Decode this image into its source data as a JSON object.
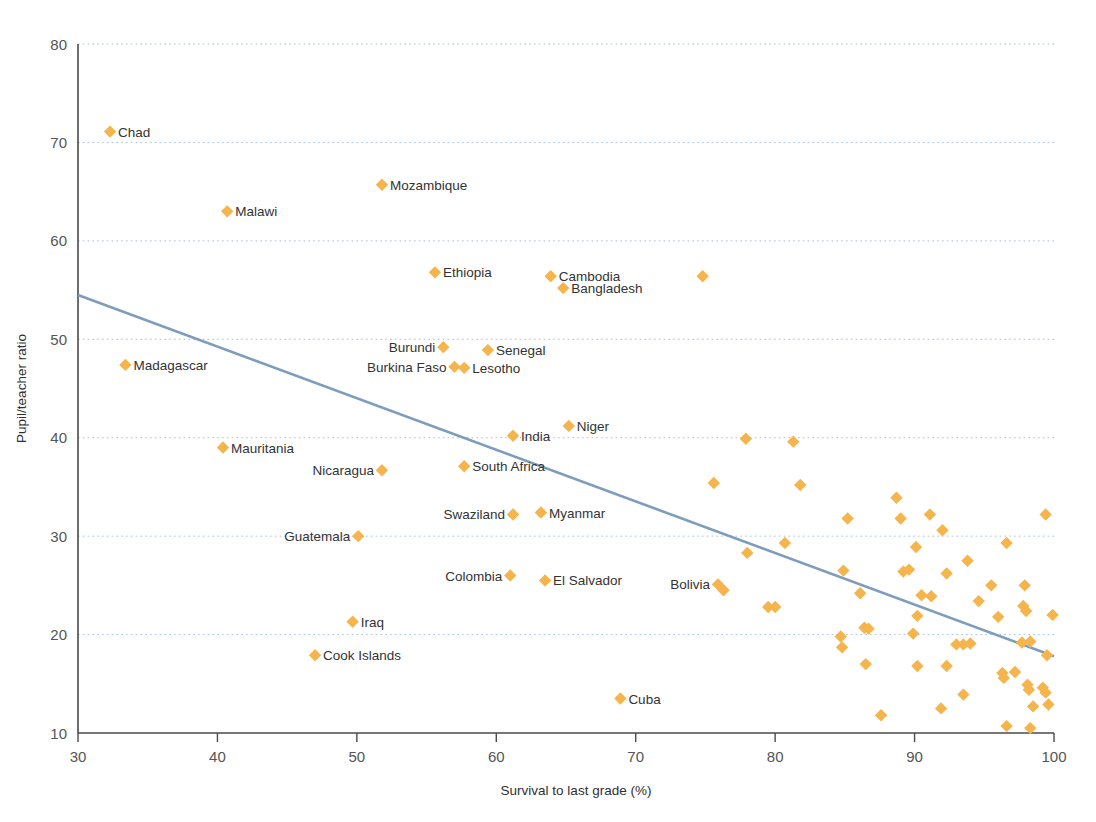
{
  "chart_data": {
    "type": "scatter",
    "title": "",
    "xlabel": "Survival to last grade (%)",
    "ylabel": "Pupil/teacher ratio",
    "xlim": [
      30,
      100
    ],
    "ylim": [
      10,
      80
    ],
    "xticks": [
      30,
      40,
      50,
      60,
      70,
      80,
      90,
      100
    ],
    "yticks": [
      10,
      20,
      30,
      40,
      50,
      60,
      70,
      80
    ],
    "grid": "horizontal-dotted",
    "legend": "none",
    "marker": "diamond",
    "marker_color": "#F5B44C",
    "trendline": {
      "type": "linear",
      "color": "#7E9CBB",
      "x": [
        30,
        100
      ],
      "y": [
        54.5,
        17.8
      ]
    },
    "labeled_points": [
      {
        "label": "Chad",
        "x": 32.3,
        "y": 71.1,
        "label_side": "right"
      },
      {
        "label": "Mozambique",
        "x": 51.8,
        "y": 65.7,
        "label_side": "right"
      },
      {
        "label": "Malawi",
        "x": 40.7,
        "y": 63.0,
        "label_side": "right"
      },
      {
        "label": "Ethiopia",
        "x": 55.6,
        "y": 56.8,
        "label_side": "right"
      },
      {
        "label": "Cambodia",
        "x": 63.9,
        "y": 56.4,
        "label_side": "right"
      },
      {
        "label": "Bangladesh",
        "x": 64.8,
        "y": 55.2,
        "label_side": "right"
      },
      {
        "label": "Burundi",
        "x": 56.2,
        "y": 49.2,
        "label_side": "left"
      },
      {
        "label": "Senegal",
        "x": 59.4,
        "y": 48.9,
        "label_side": "right"
      },
      {
        "label": "Burkina Faso",
        "x": 57.0,
        "y": 47.2,
        "label_side": "left"
      },
      {
        "label": "Lesotho",
        "x": 57.7,
        "y": 47.1,
        "label_side": "right"
      },
      {
        "label": "Madagascar",
        "x": 33.4,
        "y": 47.4,
        "label_side": "right"
      },
      {
        "label": "Niger",
        "x": 65.2,
        "y": 41.2,
        "label_side": "right"
      },
      {
        "label": "India",
        "x": 61.2,
        "y": 40.2,
        "label_side": "right"
      },
      {
        "label": "Mauritania",
        "x": 40.4,
        "y": 39.0,
        "label_side": "right"
      },
      {
        "label": "South Africa",
        "x": 57.7,
        "y": 37.1,
        "label_side": "right"
      },
      {
        "label": "Nicaragua",
        "x": 51.8,
        "y": 36.7,
        "label_side": "left"
      },
      {
        "label": "Swaziland",
        "x": 61.2,
        "y": 32.2,
        "label_side": "left"
      },
      {
        "label": "Myanmar",
        "x": 63.2,
        "y": 32.4,
        "label_side": "right"
      },
      {
        "label": "Guatemala",
        "x": 50.1,
        "y": 30.0,
        "label_side": "left"
      },
      {
        "label": "Colombia",
        "x": 61.0,
        "y": 26.0,
        "label_side": "left"
      },
      {
        "label": "El Salvador",
        "x": 63.5,
        "y": 25.5,
        "label_side": "right"
      },
      {
        "label": "Bolivia",
        "x": 75.9,
        "y": 25.1,
        "label_side": "left"
      },
      {
        "label": "Iraq",
        "x": 49.7,
        "y": 21.3,
        "label_side": "right"
      },
      {
        "label": "Cook Islands",
        "x": 47.0,
        "y": 17.9,
        "label_side": "right"
      },
      {
        "label": "Cuba",
        "x": 68.9,
        "y": 13.5,
        "label_side": "right"
      }
    ],
    "unlabeled_points": [
      {
        "x": 74.8,
        "y": 56.4
      },
      {
        "x": 77.9,
        "y": 39.9
      },
      {
        "x": 81.3,
        "y": 39.6
      },
      {
        "x": 75.6,
        "y": 35.4
      },
      {
        "x": 81.8,
        "y": 35.2
      },
      {
        "x": 88.7,
        "y": 33.9
      },
      {
        "x": 85.2,
        "y": 31.8
      },
      {
        "x": 89.0,
        "y": 31.8
      },
      {
        "x": 91.1,
        "y": 32.2
      },
      {
        "x": 99.4,
        "y": 32.2
      },
      {
        "x": 92.0,
        "y": 30.6
      },
      {
        "x": 78.0,
        "y": 28.3
      },
      {
        "x": 80.7,
        "y": 29.3
      },
      {
        "x": 90.1,
        "y": 28.9
      },
      {
        "x": 96.6,
        "y": 29.3
      },
      {
        "x": 93.8,
        "y": 27.5
      },
      {
        "x": 84.9,
        "y": 26.5
      },
      {
        "x": 89.2,
        "y": 26.4
      },
      {
        "x": 89.6,
        "y": 26.6
      },
      {
        "x": 92.3,
        "y": 26.2
      },
      {
        "x": 76.3,
        "y": 24.5
      },
      {
        "x": 86.1,
        "y": 24.2
      },
      {
        "x": 90.5,
        "y": 24.0
      },
      {
        "x": 91.2,
        "y": 23.9
      },
      {
        "x": 95.5,
        "y": 25.0
      },
      {
        "x": 97.9,
        "y": 25.0
      },
      {
        "x": 94.6,
        "y": 23.4
      },
      {
        "x": 79.5,
        "y": 22.8
      },
      {
        "x": 80.0,
        "y": 22.8
      },
      {
        "x": 90.2,
        "y": 21.9
      },
      {
        "x": 96.0,
        "y": 21.8
      },
      {
        "x": 97.8,
        "y": 22.9
      },
      {
        "x": 98.0,
        "y": 22.4
      },
      {
        "x": 99.9,
        "y": 22.0
      },
      {
        "x": 84.7,
        "y": 19.8
      },
      {
        "x": 84.8,
        "y": 18.7
      },
      {
        "x": 86.4,
        "y": 20.7
      },
      {
        "x": 86.7,
        "y": 20.6
      },
      {
        "x": 89.9,
        "y": 20.1
      },
      {
        "x": 93.0,
        "y": 19.0
      },
      {
        "x": 93.5,
        "y": 19.0
      },
      {
        "x": 94.0,
        "y": 19.1
      },
      {
        "x": 97.7,
        "y": 19.2
      },
      {
        "x": 98.3,
        "y": 19.3
      },
      {
        "x": 99.5,
        "y": 17.9
      },
      {
        "x": 86.5,
        "y": 17.0
      },
      {
        "x": 90.2,
        "y": 16.8
      },
      {
        "x": 92.3,
        "y": 16.8
      },
      {
        "x": 96.3,
        "y": 16.1
      },
      {
        "x": 96.4,
        "y": 15.6
      },
      {
        "x": 97.2,
        "y": 16.2
      },
      {
        "x": 98.1,
        "y": 14.9
      },
      {
        "x": 98.2,
        "y": 14.4
      },
      {
        "x": 99.2,
        "y": 14.6
      },
      {
        "x": 99.4,
        "y": 14.1
      },
      {
        "x": 87.6,
        "y": 11.8
      },
      {
        "x": 91.9,
        "y": 12.5
      },
      {
        "x": 93.5,
        "y": 13.9
      },
      {
        "x": 96.6,
        "y": 10.7
      },
      {
        "x": 98.3,
        "y": 10.5
      },
      {
        "x": 98.5,
        "y": 12.7
      },
      {
        "x": 99.6,
        "y": 12.9
      }
    ]
  }
}
